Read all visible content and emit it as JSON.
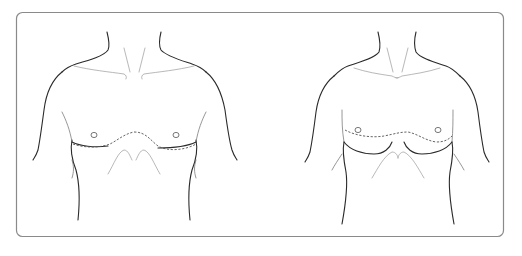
{
  "figure": {
    "type": "medical-line-illustration",
    "panels": [
      {
        "id": "male-chest",
        "incision_style": "dashed inframammary line"
      },
      {
        "id": "female-chest",
        "incision_style": "dashed line across upper chest"
      }
    ],
    "colors": {
      "background": "#ffffff",
      "frame": "#8a8a8a",
      "line": "#2a2a2a",
      "dashed": "#555555"
    }
  }
}
